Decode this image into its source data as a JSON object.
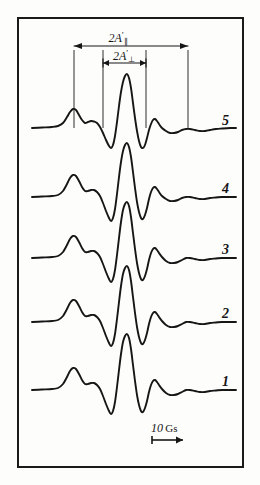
{
  "figure": {
    "kind": "esr-spectra-figure",
    "background_color": "#fdfdfc",
    "ink_color": "#161616",
    "frame": {
      "x": 18,
      "y": 18,
      "width": 225,
      "height": 449,
      "border_width": 2
    }
  },
  "annotations": {
    "parallel": {
      "base": "2A",
      "prime": "′",
      "subscript": "∥",
      "full_text": "2A′∥",
      "meaning": "parallel hyperfine splitting",
      "x_left": 74,
      "x_right": 188,
      "arrow_y": 46,
      "label_x": 118,
      "label_y": 30
    },
    "perpendicular": {
      "base": "2A",
      "prime": "′",
      "subscript": "⊥",
      "full_text": "2A′⊥",
      "meaning": "perpendicular hyperfine splitting",
      "x_left": 103,
      "x_right": 146,
      "arrow_y": 63,
      "label_x": 124,
      "label_y": 48
    },
    "guide_lines": [
      {
        "x": 74,
        "y_top": 50,
        "y_bottom": 128
      },
      {
        "x": 103,
        "y_top": 50,
        "y_bottom": 128
      },
      {
        "x": 146,
        "y_top": 50,
        "y_bottom": 128
      },
      {
        "x": 188,
        "y_top": 50,
        "y_bottom": 128
      }
    ]
  },
  "scale_bar": {
    "value": "10",
    "unit": "Gs",
    "full_text": "10 Gs",
    "label_x": 151,
    "label_y": 421,
    "arrow": {
      "x_start": 152,
      "x_end": 183,
      "y": 440
    }
  },
  "traces": [
    {
      "label": "5",
      "baseline_y": 128,
      "label_x": 222,
      "label_y": 113,
      "points": [
        [
          32,
          128
        ],
        [
          42,
          127.5
        ],
        [
          52,
          127
        ],
        [
          58,
          126
        ],
        [
          63,
          123
        ],
        [
          67,
          117
        ],
        [
          70,
          112
        ],
        [
          73,
          109
        ],
        [
          76,
          110
        ],
        [
          79,
          115
        ],
        [
          82,
          120
        ],
        [
          85,
          123
        ],
        [
          88,
          122
        ],
        [
          91,
          121
        ],
        [
          94,
          121.5
        ],
        [
          97,
          123
        ],
        [
          100,
          127
        ],
        [
          103,
          133
        ],
        [
          106,
          140
        ],
        [
          109,
          146
        ],
        [
          111,
          148
        ],
        [
          113,
          145
        ],
        [
          115,
          136
        ],
        [
          117,
          122
        ],
        [
          119,
          106
        ],
        [
          121,
          92
        ],
        [
          123,
          82
        ],
        [
          125,
          76
        ],
        [
          127,
          74
        ],
        [
          129,
          78
        ],
        [
          131,
          88
        ],
        [
          133,
          103
        ],
        [
          135,
          118
        ],
        [
          137,
          131
        ],
        [
          139,
          141
        ],
        [
          141,
          147
        ],
        [
          143,
          148
        ],
        [
          145,
          145
        ],
        [
          147,
          138
        ],
        [
          149,
          130
        ],
        [
          151,
          124
        ],
        [
          153,
          120
        ],
        [
          155,
          119
        ],
        [
          157,
          121
        ],
        [
          159,
          124
        ],
        [
          162,
          128
        ],
        [
          166,
          131
        ],
        [
          170,
          133
        ],
        [
          174,
          133
        ],
        [
          178,
          132
        ],
        [
          182,
          130
        ],
        [
          186,
          129
        ],
        [
          190,
          129
        ],
        [
          195,
          130
        ],
        [
          200,
          131
        ],
        [
          205,
          131
        ],
        [
          210,
          130
        ],
        [
          216,
          129
        ],
        [
          222,
          128.5
        ],
        [
          230,
          128
        ],
        [
          236,
          128
        ]
      ]
    },
    {
      "label": "4",
      "baseline_y": 197,
      "label_x": 222,
      "label_y": 181,
      "points": [
        [
          32,
          197
        ],
        [
          42,
          196.5
        ],
        [
          52,
          196
        ],
        [
          58,
          195
        ],
        [
          63,
          191
        ],
        [
          67,
          184
        ],
        [
          70,
          178
        ],
        [
          73,
          175
        ],
        [
          76,
          176
        ],
        [
          79,
          181
        ],
        [
          82,
          187
        ],
        [
          85,
          191
        ],
        [
          88,
          191
        ],
        [
          91,
          190
        ],
        [
          94,
          190
        ],
        [
          97,
          192
        ],
        [
          100,
          196
        ],
        [
          103,
          203
        ],
        [
          106,
          211
        ],
        [
          109,
          218
        ],
        [
          111,
          221
        ],
        [
          113,
          218
        ],
        [
          115,
          209
        ],
        [
          117,
          194
        ],
        [
          119,
          177
        ],
        [
          121,
          162
        ],
        [
          123,
          151
        ],
        [
          125,
          145
        ],
        [
          127,
          143
        ],
        [
          129,
          147
        ],
        [
          131,
          157
        ],
        [
          133,
          172
        ],
        [
          135,
          188
        ],
        [
          137,
          202
        ],
        [
          139,
          212
        ],
        [
          141,
          218
        ],
        [
          143,
          219
        ],
        [
          145,
          215
        ],
        [
          147,
          208
        ],
        [
          149,
          199
        ],
        [
          151,
          192
        ],
        [
          153,
          188
        ],
        [
          155,
          187
        ],
        [
          157,
          189
        ],
        [
          159,
          192
        ],
        [
          162,
          196
        ],
        [
          166,
          199
        ],
        [
          170,
          201
        ],
        [
          174,
          201
        ],
        [
          178,
          200
        ],
        [
          182,
          198
        ],
        [
          186,
          197
        ],
        [
          190,
          197
        ],
        [
          195,
          198
        ],
        [
          200,
          199
        ],
        [
          205,
          199
        ],
        [
          210,
          198
        ],
        [
          216,
          197.5
        ],
        [
          222,
          197
        ],
        [
          230,
          197
        ],
        [
          236,
          197
        ]
      ]
    },
    {
      "label": "3",
      "baseline_y": 258,
      "label_x": 222,
      "label_y": 242,
      "points": [
        [
          32,
          258
        ],
        [
          42,
          257.5
        ],
        [
          52,
          257
        ],
        [
          58,
          256
        ],
        [
          63,
          252
        ],
        [
          67,
          245
        ],
        [
          70,
          239
        ],
        [
          73,
          236
        ],
        [
          76,
          237
        ],
        [
          79,
          242
        ],
        [
          82,
          248
        ],
        [
          85,
          252
        ],
        [
          88,
          252
        ],
        [
          91,
          251
        ],
        [
          94,
          251
        ],
        [
          97,
          253
        ],
        [
          100,
          257
        ],
        [
          103,
          264
        ],
        [
          106,
          272
        ],
        [
          109,
          279
        ],
        [
          111,
          282
        ],
        [
          113,
          279
        ],
        [
          115,
          270
        ],
        [
          117,
          255
        ],
        [
          119,
          238
        ],
        [
          121,
          222
        ],
        [
          123,
          210
        ],
        [
          125,
          204
        ],
        [
          127,
          202
        ],
        [
          129,
          206
        ],
        [
          131,
          217
        ],
        [
          133,
          233
        ],
        [
          135,
          249
        ],
        [
          137,
          263
        ],
        [
          139,
          273
        ],
        [
          141,
          279
        ],
        [
          143,
          280
        ],
        [
          145,
          276
        ],
        [
          147,
          269
        ],
        [
          149,
          260
        ],
        [
          151,
          253
        ],
        [
          153,
          249
        ],
        [
          155,
          248
        ],
        [
          157,
          250
        ],
        [
          159,
          253
        ],
        [
          162,
          257
        ],
        [
          166,
          261
        ],
        [
          170,
          263
        ],
        [
          174,
          263
        ],
        [
          178,
          262
        ],
        [
          182,
          260
        ],
        [
          186,
          258
        ],
        [
          190,
          258
        ],
        [
          195,
          259
        ],
        [
          200,
          260
        ],
        [
          205,
          260
        ],
        [
          210,
          259
        ],
        [
          216,
          258.5
        ],
        [
          222,
          258
        ],
        [
          230,
          258
        ],
        [
          236,
          258
        ]
      ]
    },
    {
      "label": "2",
      "baseline_y": 322,
      "label_x": 222,
      "label_y": 306,
      "points": [
        [
          32,
          322
        ],
        [
          42,
          321.5
        ],
        [
          52,
          321
        ],
        [
          58,
          320
        ],
        [
          63,
          316
        ],
        [
          67,
          309
        ],
        [
          70,
          303
        ],
        [
          73,
          300
        ],
        [
          76,
          301
        ],
        [
          79,
          306
        ],
        [
          82,
          312
        ],
        [
          85,
          316
        ],
        [
          88,
          316
        ],
        [
          91,
          315
        ],
        [
          94,
          315
        ],
        [
          97,
          317
        ],
        [
          100,
          321
        ],
        [
          103,
          328
        ],
        [
          106,
          336
        ],
        [
          109,
          343
        ],
        [
          111,
          346
        ],
        [
          113,
          343
        ],
        [
          115,
          334
        ],
        [
          117,
          319
        ],
        [
          119,
          302
        ],
        [
          121,
          286
        ],
        [
          123,
          274
        ],
        [
          125,
          268
        ],
        [
          127,
          266
        ],
        [
          129,
          270
        ],
        [
          131,
          281
        ],
        [
          133,
          297
        ],
        [
          135,
          313
        ],
        [
          137,
          327
        ],
        [
          139,
          337
        ],
        [
          141,
          343
        ],
        [
          143,
          344
        ],
        [
          145,
          340
        ],
        [
          147,
          333
        ],
        [
          149,
          324
        ],
        [
          151,
          317
        ],
        [
          153,
          313
        ],
        [
          155,
          312
        ],
        [
          157,
          314
        ],
        [
          159,
          317
        ],
        [
          162,
          321
        ],
        [
          166,
          325
        ],
        [
          170,
          327
        ],
        [
          174,
          327
        ],
        [
          178,
          326
        ],
        [
          182,
          324
        ],
        [
          186,
          322
        ],
        [
          190,
          322
        ],
        [
          195,
          323
        ],
        [
          200,
          324
        ],
        [
          205,
          324
        ],
        [
          210,
          323
        ],
        [
          216,
          322.5
        ],
        [
          222,
          322
        ],
        [
          230,
          322
        ],
        [
          236,
          322
        ]
      ]
    },
    {
      "label": "1",
      "baseline_y": 390,
      "label_x": 222,
      "label_y": 374,
      "points": [
        [
          32,
          390
        ],
        [
          42,
          389.5
        ],
        [
          52,
          389
        ],
        [
          58,
          388
        ],
        [
          63,
          384
        ],
        [
          67,
          377
        ],
        [
          70,
          371
        ],
        [
          73,
          368
        ],
        [
          76,
          369
        ],
        [
          79,
          374
        ],
        [
          82,
          380
        ],
        [
          85,
          384
        ],
        [
          88,
          384
        ],
        [
          91,
          383
        ],
        [
          94,
          383
        ],
        [
          97,
          385
        ],
        [
          100,
          389
        ],
        [
          103,
          396
        ],
        [
          106,
          404
        ],
        [
          109,
          411
        ],
        [
          111,
          414
        ],
        [
          113,
          411
        ],
        [
          115,
          402
        ],
        [
          117,
          387
        ],
        [
          119,
          370
        ],
        [
          121,
          354
        ],
        [
          123,
          342
        ],
        [
          125,
          336
        ],
        [
          127,
          334
        ],
        [
          129,
          338
        ],
        [
          131,
          349
        ],
        [
          133,
          365
        ],
        [
          135,
          381
        ],
        [
          137,
          395
        ],
        [
          139,
          405
        ],
        [
          141,
          411
        ],
        [
          143,
          412
        ],
        [
          145,
          408
        ],
        [
          147,
          401
        ],
        [
          149,
          392
        ],
        [
          151,
          385
        ],
        [
          153,
          381
        ],
        [
          155,
          380
        ],
        [
          157,
          382
        ],
        [
          159,
          385
        ],
        [
          162,
          389
        ],
        [
          166,
          393
        ],
        [
          170,
          395
        ],
        [
          174,
          395
        ],
        [
          178,
          394
        ],
        [
          182,
          392
        ],
        [
          186,
          390
        ],
        [
          190,
          390
        ],
        [
          195,
          391
        ],
        [
          200,
          392
        ],
        [
          205,
          392
        ],
        [
          210,
          391
        ],
        [
          216,
          390.5
        ],
        [
          222,
          390
        ],
        [
          230,
          390
        ],
        [
          236,
          390
        ]
      ]
    }
  ]
}
